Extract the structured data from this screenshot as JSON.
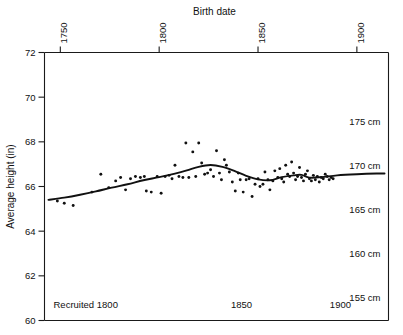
{
  "chart_data": {
    "type": "scatter",
    "title": "Birth date",
    "xlabel": "Birth date",
    "ylabel": "Average height (in)",
    "xlim": [
      1742,
      1916
    ],
    "ylim": [
      60,
      72
    ],
    "grid": false,
    "legend": null,
    "x_axis_position": "top",
    "x_ticks": [
      1750,
      1800,
      1850,
      1900
    ],
    "x_tick_labels": [
      "1750",
      "1800",
      "1850",
      "1900"
    ],
    "y_ticks": [
      60,
      62,
      64,
      66,
      68,
      70,
      72
    ],
    "y_tick_labels": [
      "60",
      "62",
      "64",
      "66",
      "68",
      "70",
      "72"
    ],
    "secondary_axis": {
      "position": "right",
      "unit": "cm",
      "labels": [
        "175 cm",
        "170 cm",
        "165 cm",
        "160 cm",
        "155 cm"
      ],
      "values_cm": [
        175,
        170,
        165,
        160,
        155
      ],
      "values_in": [
        68.9,
        66.93,
        64.96,
        62.99,
        61.02
      ]
    },
    "inner_bottom_labels": [
      {
        "text": "Recruited 1800",
        "x": 1800
      },
      {
        "text": "1850",
        "x": 1850
      },
      {
        "text": "1900",
        "x": 1900
      }
    ],
    "series": [
      {
        "name": "Average height by birth cohort",
        "marker": "dot",
        "color": "#111111",
        "points": [
          [
            1748.5,
            65.35
          ],
          [
            1752.0,
            65.25
          ],
          [
            1756.5,
            65.15
          ],
          [
            1766.0,
            65.75
          ],
          [
            1770.5,
            66.55
          ],
          [
            1774.5,
            65.95
          ],
          [
            1778.0,
            66.25
          ],
          [
            1780.5,
            66.4
          ],
          [
            1783.0,
            65.85
          ],
          [
            1785.5,
            66.35
          ],
          [
            1788.0,
            66.45
          ],
          [
            1790.5,
            66.4
          ],
          [
            1792.5,
            66.45
          ],
          [
            1793.5,
            65.8
          ],
          [
            1796.0,
            65.75
          ],
          [
            1799.0,
            66.45
          ],
          [
            1801.0,
            65.7
          ],
          [
            1803.0,
            66.45
          ],
          [
            1805.0,
            66.5
          ],
          [
            1806.5,
            66.35
          ],
          [
            1808.0,
            66.95
          ],
          [
            1810.0,
            66.45
          ],
          [
            1812.0,
            66.4
          ],
          [
            1813.5,
            67.95
          ],
          [
            1815.0,
            66.4
          ],
          [
            1817.0,
            67.55
          ],
          [
            1818.5,
            66.45
          ],
          [
            1820.0,
            67.95
          ],
          [
            1821.5,
            67.05
          ],
          [
            1823.0,
            66.55
          ],
          [
            1824.5,
            66.6
          ],
          [
            1826.0,
            66.75
          ],
          [
            1827.5,
            66.45
          ],
          [
            1829.0,
            67.6
          ],
          [
            1830.5,
            66.6
          ],
          [
            1831.5,
            66.3
          ],
          [
            1833.0,
            67.2
          ],
          [
            1834.0,
            66.95
          ],
          [
            1835.5,
            66.65
          ],
          [
            1837.0,
            66.2
          ],
          [
            1838.5,
            65.8
          ],
          [
            1840.0,
            66.6
          ],
          [
            1841.0,
            66.3
          ],
          [
            1842.5,
            65.75
          ],
          [
            1844.0,
            66.3
          ],
          [
            1845.5,
            66.35
          ],
          [
            1847.0,
            65.55
          ],
          [
            1848.5,
            66.1
          ],
          [
            1850.0,
            66.35
          ],
          [
            1851.0,
            66.0
          ],
          [
            1852.5,
            66.1
          ],
          [
            1853.5,
            66.65
          ],
          [
            1855.0,
            66.3
          ],
          [
            1856.0,
            65.85
          ],
          [
            1857.5,
            66.25
          ],
          [
            1858.5,
            66.7
          ],
          [
            1860.0,
            66.4
          ],
          [
            1861.0,
            66.8
          ],
          [
            1862.0,
            66.35
          ],
          [
            1863.0,
            66.2
          ],
          [
            1864.0,
            66.95
          ],
          [
            1865.0,
            66.55
          ],
          [
            1866.0,
            66.45
          ],
          [
            1867.0,
            67.1
          ],
          [
            1868.0,
            66.6
          ],
          [
            1869.0,
            66.3
          ],
          [
            1870.0,
            66.45
          ],
          [
            1871.0,
            66.85
          ],
          [
            1872.0,
            66.4
          ],
          [
            1873.0,
            66.25
          ],
          [
            1874.0,
            66.55
          ],
          [
            1875.0,
            66.7
          ],
          [
            1876.0,
            66.35
          ],
          [
            1877.0,
            66.25
          ],
          [
            1878.0,
            66.5
          ],
          [
            1879.0,
            66.3
          ],
          [
            1880.0,
            66.45
          ],
          [
            1881.0,
            66.2
          ],
          [
            1882.0,
            66.4
          ],
          [
            1883.0,
            66.35
          ],
          [
            1884.0,
            66.55
          ],
          [
            1885.0,
            66.45
          ],
          [
            1886.0,
            66.3
          ],
          [
            1887.0,
            66.4
          ],
          [
            1888.0,
            66.35
          ]
        ]
      }
    ],
    "fit_curve": {
      "name": "smoothed trend",
      "color": "#111111",
      "points": [
        [
          1744.0,
          65.4
        ],
        [
          1752.0,
          65.5
        ],
        [
          1760.0,
          65.63
        ],
        [
          1768.0,
          65.78
        ],
        [
          1776.0,
          65.95
        ],
        [
          1784.0,
          66.1
        ],
        [
          1792.0,
          66.28
        ],
        [
          1800.0,
          66.42
        ],
        [
          1808.0,
          66.58
        ],
        [
          1814.0,
          66.72
        ],
        [
          1820.0,
          66.88
        ],
        [
          1826.0,
          66.96
        ],
        [
          1832.0,
          66.88
        ],
        [
          1838.0,
          66.7
        ],
        [
          1844.0,
          66.48
        ],
        [
          1850.0,
          66.32
        ],
        [
          1856.0,
          66.28
        ],
        [
          1862.0,
          66.42
        ],
        [
          1868.0,
          66.5
        ],
        [
          1872.0,
          66.52
        ],
        [
          1876.0,
          66.4
        ],
        [
          1882.0,
          66.42
        ],
        [
          1890.0,
          66.5
        ],
        [
          1900.0,
          66.55
        ],
        [
          1910.0,
          66.58
        ],
        [
          1914.0,
          66.58
        ]
      ]
    }
  }
}
